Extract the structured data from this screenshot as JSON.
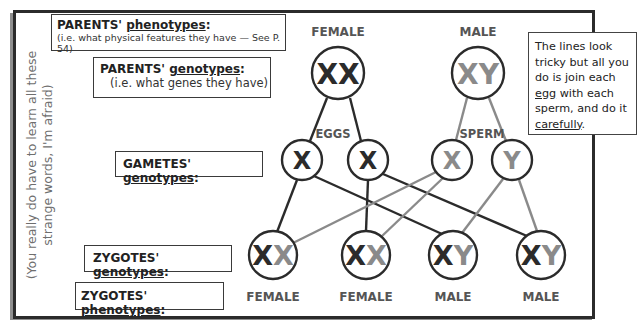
{
  "side_note": "(You really do have to learn all these strange words, I'm afraid)",
  "labels": {
    "parents_phenotypes": {
      "prefix": "PARENTS'",
      "term": "phenotypes",
      "suffix": ":",
      "sub": "(i.e. what physical features they have — See P. 54)"
    },
    "parents_genotypes": {
      "prefix": "PARENTS'",
      "term": "genotypes",
      "suffix": ":",
      "sub": "(i.e. what genes they have)"
    },
    "gametes_genotypes": {
      "prefix": "GAMETES'",
      "term": "genotypes",
      "suffix": ":"
    },
    "zygotes_genotypes": {
      "prefix": "ZYGOTES'",
      "term": "genotypes",
      "suffix": ":"
    },
    "zygotes_phenotypes": {
      "prefix": "ZYGOTES'",
      "term": "phenotypes",
      "suffix": ":"
    }
  },
  "note": {
    "line1": "The lines look tricky but all you do is join each",
    "egg": "egg",
    "line2": " with each sperm, and do it ",
    "carefully": "carefully",
    "end": "."
  },
  "parents": [
    {
      "phenotype": "FEMALE",
      "genotype": [
        "X",
        "X"
      ],
      "colors": [
        "#2b2b2b",
        "#2b2b2b"
      ]
    },
    {
      "phenotype": "MALE",
      "genotype": [
        "X",
        "Y"
      ],
      "colors": [
        "#8a8a8a",
        "#8a8a8a"
      ]
    }
  ],
  "gamete_groups": {
    "eggs": "EGGS",
    "sperm": "SPERM"
  },
  "gametes": [
    {
      "allele": "X",
      "source": "egg"
    },
    {
      "allele": "X",
      "source": "egg"
    },
    {
      "allele": "X",
      "source": "sperm"
    },
    {
      "allele": "Y",
      "source": "sperm"
    }
  ],
  "zygotes": [
    {
      "genotype": [
        "X",
        "X"
      ],
      "phenotype": "FEMALE"
    },
    {
      "genotype": [
        "X",
        "X"
      ],
      "phenotype": "FEMALE"
    },
    {
      "genotype": [
        "X",
        "Y"
      ],
      "phenotype": "MALE"
    },
    {
      "genotype": [
        "X",
        "Y"
      ],
      "phenotype": "MALE"
    }
  ],
  "colors": {
    "female": "#2b2b2b",
    "male": "#8a8a8a",
    "frame": "#2b2b2b",
    "shadow": "#8f8f8f"
  }
}
